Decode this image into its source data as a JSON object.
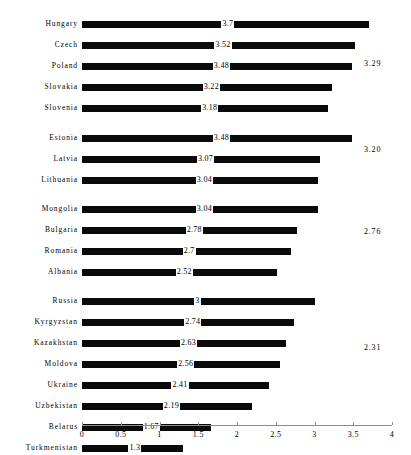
{
  "chart_data": {
    "type": "bar",
    "orientation": "horizontal",
    "title": "",
    "subtitle": "",
    "xlabel": "",
    "ylabel": "",
    "xlim": [
      0,
      4
    ],
    "xticks": [
      0,
      0.5,
      1,
      1.5,
      2,
      2.5,
      3,
      3.5,
      4
    ],
    "xtick_labels": [
      "0",
      "0.5",
      "1",
      "1.5",
      "2",
      "2.5",
      "3",
      "3.5",
      "4"
    ],
    "grid": false,
    "legend": null,
    "bar_color": "#0a0a0a",
    "axis_color": "#8c8c8c",
    "categories": [
      "Hungary",
      "Czech",
      "Poland",
      "Slovakia",
      "Slovenia",
      "Estonia",
      "Latvia",
      "Lithuania",
      "Mongolia",
      "Bulgaria",
      "Romania",
      "Albania",
      "Russia",
      "Kyrgyzstan",
      "Kazakhstan",
      "Moldova",
      "Ukraine",
      "Uzbekistan",
      "Belarus",
      "Turkmenistan"
    ],
    "values": [
      3.7,
      3.52,
      3.48,
      3.22,
      3.18,
      3.48,
      3.07,
      3.04,
      3.04,
      2.78,
      2.7,
      2.52,
      3,
      2.74,
      2.63,
      2.56,
      2.41,
      2.19,
      1.67,
      1.3
    ],
    "value_labels": [
      "3.7",
      "3.52",
      "3.48",
      "3.22",
      "3.18",
      "3.48",
      "3.07",
      "3.04",
      "3.04",
      "2.78",
      "2.7",
      "2.52",
      "3",
      "2.74",
      "2.63",
      "2.56",
      "2.41",
      "2.19",
      "1.67",
      "1.3"
    ],
    "groups": [
      {
        "name": "group-1",
        "average": 3.29,
        "average_label": "3.29",
        "categories": [
          "Hungary",
          "Czech",
          "Poland",
          "Slovakia",
          "Slovenia"
        ],
        "values": [
          3.7,
          3.52,
          3.48,
          3.22,
          3.18
        ]
      },
      {
        "name": "group-2",
        "average": 3.2,
        "average_label": "3.20",
        "categories": [
          "Estonia",
          "Latvia",
          "Lithuania"
        ],
        "values": [
          3.48,
          3.07,
          3.04
        ]
      },
      {
        "name": "group-3",
        "average": 2.76,
        "average_label": "2.76",
        "categories": [
          "Mongolia",
          "Bulgaria",
          "Romania",
          "Albania"
        ],
        "values": [
          3.04,
          2.78,
          2.7,
          2.52
        ]
      },
      {
        "name": "group-4",
        "average": 2.31,
        "average_label": "2.31",
        "categories": [
          "Russia",
          "Kyrgyzstan",
          "Kazakhstan",
          "Moldova",
          "Ukraine",
          "Uzbekistan",
          "Belarus",
          "Turkmenistan"
        ],
        "values": [
          3,
          2.74,
          2.63,
          2.56,
          2.41,
          2.19,
          1.67,
          1.3
        ]
      }
    ]
  },
  "rows": [
    {
      "label": "Hungary",
      "value": 3.7,
      "value_label": "3.7",
      "y": 17,
      "group": 0
    },
    {
      "label": "Czech",
      "value": 3.52,
      "value_label": "3.52",
      "y": 38,
      "group": 0
    },
    {
      "label": "Poland",
      "value": 3.48,
      "value_label": "3.48",
      "y": 59,
      "group": 0
    },
    {
      "label": "Slovakia",
      "value": 3.22,
      "value_label": "3.22",
      "y": 80,
      "group": 0
    },
    {
      "label": "Slovenia",
      "value": 3.18,
      "value_label": "3.18",
      "y": 101,
      "group": 0
    },
    {
      "label": "Estonia",
      "value": 3.48,
      "value_label": "3.48",
      "y": 131,
      "group": 1
    },
    {
      "label": "Latvia",
      "value": 3.07,
      "value_label": "3.07",
      "y": 152,
      "group": 1
    },
    {
      "label": "Lithuania",
      "value": 3.04,
      "value_label": "3.04",
      "y": 173,
      "group": 1
    },
    {
      "label": "Mongolia",
      "value": 3.04,
      "value_label": "3.04",
      "y": 202,
      "group": 2
    },
    {
      "label": "Bulgaria",
      "value": 2.78,
      "value_label": "2.78",
      "y": 223,
      "group": 2
    },
    {
      "label": "Romania",
      "value": 2.7,
      "value_label": "2.7",
      "y": 244,
      "group": 2
    },
    {
      "label": "Albania",
      "value": 2.52,
      "value_label": "2.52",
      "y": 265,
      "group": 2
    },
    {
      "label": "Russia",
      "value": 3,
      "value_label": "3",
      "y": 294,
      "group": 3
    },
    {
      "label": "Kyrgyzstan",
      "value": 2.74,
      "value_label": "2.74",
      "y": 315,
      "group": 3
    },
    {
      "label": "Kazakhstan",
      "value": 2.63,
      "value_label": "2.63",
      "y": 336,
      "group": 3
    },
    {
      "label": "Moldova",
      "value": 2.56,
      "value_label": "2.56",
      "y": 357,
      "group": 3
    },
    {
      "label": "Ukraine",
      "value": 2.41,
      "value_label": "2.41",
      "y": 378,
      "group": 3
    },
    {
      "label": "Uzbekistan",
      "value": 2.19,
      "value_label": "2.19",
      "y": 399,
      "group": 3
    },
    {
      "label": "Belarus",
      "value": 1.67,
      "value_label": "1.67",
      "y": 420,
      "group": 3
    },
    {
      "label": "Turkmenistan",
      "value": 1.3,
      "value_label": "1.3",
      "y": 441,
      "group": 3
    }
  ],
  "group_annotations": [
    {
      "label": "3.29",
      "y": 59,
      "x": 364
    },
    {
      "label": "3.20",
      "y": 145,
      "x": 364
    },
    {
      "label": "2.76",
      "y": 227,
      "x": 364
    },
    {
      "label": "2.31",
      "y": 343,
      "x": 364
    }
  ],
  "axis": {
    "ticks": [
      {
        "label": "0",
        "value": 0
      },
      {
        "label": "0.5",
        "value": 0.5
      },
      {
        "label": "1",
        "value": 1
      },
      {
        "label": "1.5",
        "value": 1.5
      },
      {
        "label": "2",
        "value": 2
      },
      {
        "label": "2.5",
        "value": 2.5
      },
      {
        "label": "3",
        "value": 3
      },
      {
        "label": "3.5",
        "value": 3.5
      },
      {
        "label": "4",
        "value": 4
      }
    ]
  },
  "geometry": {
    "x0": 82,
    "x1": 392,
    "axis_y": 425,
    "row_height": 14,
    "bar_height": 7
  }
}
